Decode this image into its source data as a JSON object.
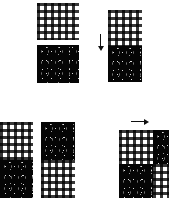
{
  "figure": {
    "title": "",
    "background_color": "#ffffff",
    "width": 169,
    "height": 202,
    "texture_names": {
      "gingham": "gingham-plaid-texture",
      "dots": "speckled-dot-texture"
    },
    "colors": {
      "gingham_light": "#ffffff",
      "gingham_dark": "#000000",
      "dots_ground": "#050505",
      "dots_fleck": "#ffffff",
      "arrow": "#101010",
      "background": "#ffffff"
    }
  },
  "panels": [
    {
      "id": "top-left",
      "name": "vertical-inputs-panel",
      "label": "",
      "arrow": null,
      "tiles": [
        {
          "texture": "gingham",
          "position": "upper"
        },
        {
          "texture": "dots",
          "position": "lower"
        }
      ]
    },
    {
      "id": "top-right",
      "name": "vertical-result-panel",
      "label": "",
      "arrow": {
        "direction": "down",
        "name": "down-arrow-icon",
        "glyph": "↓"
      },
      "tiles": [
        {
          "texture": "gingham",
          "position": "upper"
        },
        {
          "texture": "dots",
          "position": "lower"
        }
      ]
    },
    {
      "id": "bottom-left",
      "name": "horizontal-inputs-panel",
      "label": "",
      "arrow": null,
      "tiles": [
        {
          "texture": "gingham",
          "position": "left-upper"
        },
        {
          "texture": "dots",
          "position": "left-lower"
        },
        {
          "texture": "dots",
          "position": "right-upper"
        },
        {
          "texture": "gingham",
          "position": "right-lower"
        }
      ]
    },
    {
      "id": "bottom-right",
      "name": "checkerboard-result-panel",
      "label": "",
      "arrow": {
        "direction": "right",
        "name": "right-arrow-icon",
        "glyph": "→"
      },
      "tiles": [
        {
          "texture": "gingham",
          "position": "top-left"
        },
        {
          "texture": "dots",
          "position": "top-right"
        },
        {
          "texture": "dots",
          "position": "bottom-left"
        },
        {
          "texture": "gingham",
          "position": "bottom-right"
        }
      ]
    }
  ]
}
